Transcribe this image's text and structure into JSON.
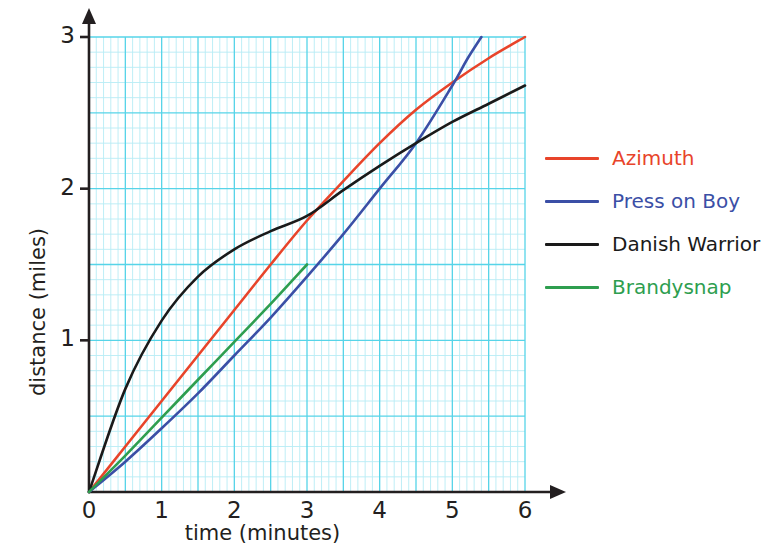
{
  "chart_data": {
    "type": "line",
    "title": "",
    "xlabel": "time (minutes)",
    "ylabel": "distance (miles)",
    "xlim": [
      0,
      6
    ],
    "ylim": [
      0,
      3
    ],
    "xticks": [
      "0",
      "1",
      "2",
      "3",
      "4",
      "5",
      "6"
    ],
    "yticks": [
      "1",
      "2",
      "3"
    ],
    "grid": true,
    "grid_major_step": 0.5,
    "grid_minor_step": 0.1,
    "grid_color": "#56d4e8",
    "grid_minor_color": "#b8ecf5",
    "axis_color": "#231f20",
    "legend_position": "right",
    "series": [
      {
        "name": "Azimuth",
        "color": "#e8442a",
        "x": [
          0,
          0.5,
          1,
          1.5,
          2,
          2.5,
          3,
          3.5,
          4,
          4.5,
          5,
          5.5,
          6
        ],
        "y": [
          0,
          0.3,
          0.6,
          0.9,
          1.2,
          1.5,
          1.79,
          2.05,
          2.3,
          2.52,
          2.7,
          2.86,
          3.0
        ]
      },
      {
        "name": "Press on Boy",
        "color": "#3b4fa6",
        "x": [
          0,
          0.5,
          1,
          1.5,
          2,
          2.5,
          3,
          3.5,
          4,
          4.5,
          5,
          5.2,
          5.4
        ],
        "y": [
          0,
          0.2,
          0.42,
          0.65,
          0.9,
          1.15,
          1.42,
          1.7,
          2.0,
          2.3,
          2.68,
          2.85,
          3.0
        ]
      },
      {
        "name": "Danish Warrior",
        "color": "#1a1a1a",
        "x": [
          0,
          0.5,
          1,
          1.5,
          2,
          2.5,
          3,
          3.5,
          4,
          4.5,
          5,
          5.5,
          6
        ],
        "y": [
          0,
          0.68,
          1.13,
          1.42,
          1.6,
          1.72,
          1.82,
          1.99,
          2.15,
          2.3,
          2.44,
          2.56,
          2.68
        ]
      },
      {
        "name": "Brandysnap",
        "color": "#2e9e4f",
        "x": [
          0,
          0.5,
          1,
          1.5,
          2,
          2.5,
          3
        ],
        "y": [
          0,
          0.24,
          0.49,
          0.74,
          0.99,
          1.24,
          1.5
        ]
      }
    ]
  },
  "legend": {
    "items": [
      {
        "label": "Azimuth",
        "color": "#e8442a"
      },
      {
        "label": "Press on Boy",
        "color": "#3b4fa6"
      },
      {
        "label": "Danish Warrior",
        "color": "#1a1a1a"
      },
      {
        "label": "Brandysnap",
        "color": "#2e9e4f"
      }
    ]
  },
  "axes": {
    "x_title": "time (minutes)",
    "y_title": "distance (miles)",
    "x_tick_labels": [
      "0",
      "1",
      "2",
      "3",
      "4",
      "5",
      "6"
    ],
    "y_tick_labels": [
      "1",
      "2",
      "3"
    ]
  }
}
